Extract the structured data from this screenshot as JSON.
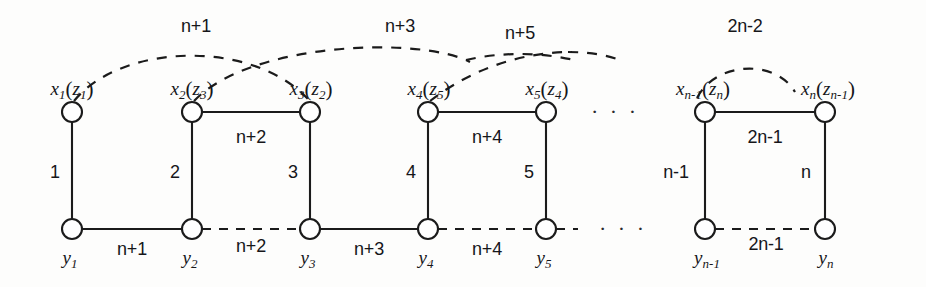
{
  "figure": {
    "kind": "graph-labeling-diagram",
    "width": 926,
    "height": 287,
    "ink_color": "#1b1b1b",
    "background_color": "#fdfdfc"
  },
  "top_vertices": [
    {
      "id": "x1",
      "main": "x",
      "main_sub": "1",
      "alt": "z",
      "alt_sub": "1",
      "x": 72,
      "y": 112
    },
    {
      "id": "x2",
      "main": "x",
      "main_sub": "2",
      "alt": "z",
      "alt_sub": "3",
      "x": 192,
      "y": 112
    },
    {
      "id": "x3",
      "main": "x",
      "main_sub": "3",
      "alt": "z",
      "alt_sub": "2",
      "x": 310,
      "y": 112
    },
    {
      "id": "x4",
      "main": "x",
      "main_sub": "4",
      "alt": "z",
      "alt_sub": "5",
      "x": 428,
      "y": 112
    },
    {
      "id": "x5",
      "main": "x",
      "main_sub": "5",
      "alt": "z",
      "alt_sub": "4",
      "x": 546,
      "y": 112
    },
    {
      "id": "xn-1",
      "main": "x",
      "main_sub": "n-1",
      "alt": "z",
      "alt_sub": "n",
      "x": 705,
      "y": 112
    },
    {
      "id": "xn",
      "main": "x",
      "main_sub": "n",
      "alt": "z",
      "alt_sub": "n-1",
      "x": 825,
      "y": 112
    }
  ],
  "bottom_vertices": [
    {
      "id": "y1",
      "main": "y",
      "main_sub": "1",
      "x": 72,
      "y": 229
    },
    {
      "id": "y2",
      "main": "y",
      "main_sub": "2",
      "x": 192,
      "y": 229
    },
    {
      "id": "y3",
      "main": "y",
      "main_sub": "3",
      "x": 310,
      "y": 229
    },
    {
      "id": "y4",
      "main": "y",
      "main_sub": "4",
      "x": 428,
      "y": 229
    },
    {
      "id": "y5",
      "main": "y",
      "main_sub": "5",
      "x": 546,
      "y": 229
    },
    {
      "id": "yn-1",
      "main": "y",
      "main_sub": "n-1",
      "x": 705,
      "y": 229
    },
    {
      "id": "yn",
      "main": "y",
      "main_sub": "n",
      "x": 825,
      "y": 229
    }
  ],
  "vertical_edges": [
    {
      "id": "v1",
      "from": "x1",
      "to": "y1",
      "label": "1",
      "x": 72,
      "label_x": 55,
      "label_y": 170,
      "style": "solid"
    },
    {
      "id": "v2",
      "from": "x2",
      "to": "y2",
      "label": "2",
      "x": 192,
      "label_x": 175,
      "label_y": 170,
      "style": "solid"
    },
    {
      "id": "v3",
      "from": "x3",
      "to": "y3",
      "label": "3",
      "x": 310,
      "label_x": 293,
      "label_y": 170,
      "style": "solid"
    },
    {
      "id": "v4",
      "from": "x4",
      "to": "y4",
      "label": "4",
      "x": 428,
      "label_x": 411,
      "label_y": 170,
      "style": "solid"
    },
    {
      "id": "v5",
      "from": "x5",
      "to": "y5",
      "label": "5",
      "x": 546,
      "label_x": 529,
      "label_y": 170,
      "style": "solid"
    },
    {
      "id": "vn-1",
      "from": "xn-1",
      "to": "yn-1",
      "label": "n-1",
      "x": 705,
      "label_x": 672,
      "label_y": 170,
      "style": "solid"
    },
    {
      "id": "vn",
      "from": "xn",
      "to": "yn",
      "label": "n",
      "x": 825,
      "label_x": 804,
      "label_y": 170,
      "style": "solid"
    }
  ],
  "top_edges": [
    {
      "id": "t23",
      "from": "x2",
      "to": "x3",
      "label": "n+2",
      "label_x": 251,
      "label_y": 128,
      "style": "solid"
    },
    {
      "id": "t45",
      "from": "x4",
      "to": "x5",
      "label": "n+4",
      "label_x": 487,
      "label_y": 128,
      "style": "solid"
    },
    {
      "id": "tn",
      "from": "xn-1",
      "to": "xn",
      "label": "2n-1",
      "label_x": 765,
      "label_y": 128,
      "style": "solid"
    }
  ],
  "bottom_edges": [
    {
      "id": "b12",
      "from": "y1",
      "to": "y2",
      "label": "n+1",
      "label_x": 132,
      "label_y": 242,
      "style": "solid"
    },
    {
      "id": "b23",
      "from": "y2",
      "to": "y3",
      "label": "n+2",
      "label_x": 251,
      "label_y": 240,
      "style": "dashed"
    },
    {
      "id": "b34",
      "from": "y3",
      "to": "y4",
      "label": "n+3",
      "label_x": 369,
      "label_y": 242,
      "style": "solid"
    },
    {
      "id": "b45",
      "from": "y4",
      "to": "y5",
      "label": "n+4",
      "label_x": 487,
      "label_y": 242,
      "style": "dashed"
    },
    {
      "id": "bn",
      "from": "yn-1",
      "to": "yn",
      "label": "2n-1",
      "label_x": 767,
      "label_y": 238,
      "style": "dashed"
    }
  ],
  "arcs": [
    {
      "id": "a1",
      "label": "n+1",
      "from": "x1",
      "to": "x3",
      "label_x": 196,
      "label_y": 17,
      "style": "dashed"
    },
    {
      "id": "a2",
      "label": "n+3",
      "from": "x2",
      "to": "x5",
      "label_x": 400,
      "label_y": 17,
      "style": "dashed"
    },
    {
      "id": "a3",
      "label": "n+5",
      "from": "x4",
      "to": "right",
      "label_x": 520,
      "label_y": 24,
      "style": "dashed"
    },
    {
      "id": "a4",
      "label": "2n-2",
      "from": "xn-1",
      "to": "xn",
      "label_x": 745,
      "label_y": 17,
      "style": "dashed"
    }
  ],
  "ellipses": [
    {
      "id": "e-top",
      "glyph": "· · ·",
      "x": 615,
      "y": 105
    },
    {
      "id": "e-bottom",
      "glyph": "· · ·",
      "x": 623,
      "y": 222
    }
  ]
}
